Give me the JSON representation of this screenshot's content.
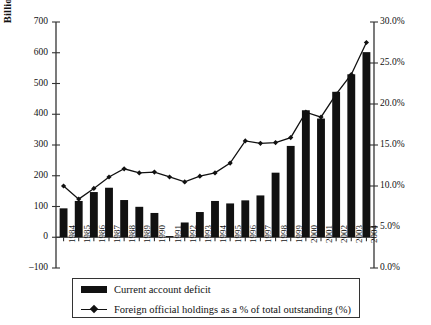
{
  "chart_data": {
    "type": "bar",
    "title": "",
    "categories": [
      "1984",
      "1985",
      "1986",
      "1987",
      "1988",
      "1989",
      "1990",
      "1991",
      "1992",
      "1993",
      "1994",
      "1995",
      "1996",
      "1997",
      "1998",
      "1999",
      "2000",
      "2001",
      "2002",
      "2003",
      "2004"
    ],
    "series": [
      {
        "name": "Current account deficit",
        "type": "bar",
        "axis": "left",
        "unit": "Billions of U.S. Dollars",
        "values": [
          94,
          118,
          147,
          161,
          121,
          99,
          79,
          3,
          48,
          82,
          118,
          110,
          120,
          136,
          210,
          297,
          413,
          386,
          473,
          530,
          602
        ]
      },
      {
        "name": "Foreign official holdings as a % of total outstanding (%)",
        "type": "line",
        "axis": "right",
        "unit": "%",
        "values": [
          10.0,
          8.4,
          9.7,
          11.1,
          12.1,
          11.6,
          11.7,
          11.1,
          10.5,
          11.2,
          11.6,
          12.8,
          15.5,
          15.2,
          15.3,
          15.9,
          19.0,
          18.4,
          21.2,
          23.6,
          27.5
        ]
      }
    ],
    "xlabel": "",
    "ylabel": "Billions of U.S. Dollars",
    "ylabel_right": "",
    "ylim": [
      -100,
      700
    ],
    "ylim_right": [
      0,
      30
    ],
    "yticks": [
      "-100",
      "0",
      "100",
      "200",
      "300",
      "400",
      "500",
      "600",
      "700"
    ],
    "yticks_right": [
      "0.0%",
      "5.0%",
      "10.0%",
      "15.0%",
      "20.0%",
      "25.0%",
      "30.0%"
    ],
    "grid": false,
    "legend_position": "bottom"
  },
  "legend": {
    "items": [
      {
        "label": "Current account deficit",
        "marker": "bar-swatch",
        "color": "#111111"
      },
      {
        "label": "Foreign official holdings as a % of total outstanding (%)",
        "marker": "line-diamond-swatch",
        "color": "#111111"
      }
    ]
  },
  "colors": {
    "bar": "#111111",
    "line": "#111111",
    "axis": "#333333",
    "background": "#ffffff"
  }
}
